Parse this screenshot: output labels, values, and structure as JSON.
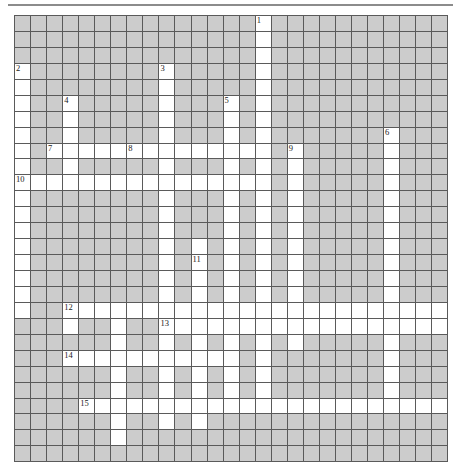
{
  "puzzle": {
    "type": "crossword-grid",
    "title": "",
    "columns": 27,
    "rows": 28,
    "cell_size_px": 16,
    "colors": {
      "block": "#cccccc",
      "open": "#ffffff",
      "gridline": "#5a5a5a",
      "rule": "#8c8c8c",
      "number": "#1a1a1a",
      "page": "#ffffff"
    },
    "numbers": [
      {
        "n": "1",
        "row": 0,
        "col": 15
      },
      {
        "n": "2",
        "row": 3,
        "col": 0
      },
      {
        "n": "3",
        "row": 3,
        "col": 9
      },
      {
        "n": "4",
        "row": 5,
        "col": 3
      },
      {
        "n": "5",
        "row": 5,
        "col": 13
      },
      {
        "n": "6",
        "row": 7,
        "col": 23
      },
      {
        "n": "7",
        "row": 8,
        "col": 2
      },
      {
        "n": "8",
        "row": 8,
        "col": 7
      },
      {
        "n": "9",
        "row": 8,
        "col": 17
      },
      {
        "n": "10",
        "row": 10,
        "col": 0
      },
      {
        "n": "11",
        "row": 15,
        "col": 11
      },
      {
        "n": "12",
        "row": 18,
        "col": 3
      },
      {
        "n": "13",
        "row": 19,
        "col": 9
      },
      {
        "n": "14",
        "row": 21,
        "col": 3
      },
      {
        "n": "15",
        "row": 24,
        "col": 4
      }
    ],
    "open_cells": [
      [
        0,
        15
      ],
      [
        1,
        15
      ],
      [
        2,
        15
      ],
      [
        3,
        0
      ],
      [
        3,
        9
      ],
      [
        3,
        15
      ],
      [
        4,
        0
      ],
      [
        4,
        9
      ],
      [
        4,
        15
      ],
      [
        5,
        0
      ],
      [
        5,
        3
      ],
      [
        5,
        9
      ],
      [
        5,
        13
      ],
      [
        5,
        15
      ],
      [
        6,
        0
      ],
      [
        6,
        3
      ],
      [
        6,
        9
      ],
      [
        6,
        13
      ],
      [
        6,
        15
      ],
      [
        7,
        0
      ],
      [
        7,
        3
      ],
      [
        7,
        9
      ],
      [
        7,
        13
      ],
      [
        7,
        15
      ],
      [
        7,
        23
      ],
      [
        8,
        0
      ],
      [
        8,
        2
      ],
      [
        8,
        3
      ],
      [
        8,
        4
      ],
      [
        8,
        5
      ],
      [
        8,
        6
      ],
      [
        8,
        7
      ],
      [
        8,
        8
      ],
      [
        8,
        9
      ],
      [
        8,
        10
      ],
      [
        8,
        11
      ],
      [
        8,
        12
      ],
      [
        8,
        13
      ],
      [
        8,
        14
      ],
      [
        8,
        15
      ],
      [
        8,
        17
      ],
      [
        8,
        23
      ],
      [
        9,
        0
      ],
      [
        9,
        3
      ],
      [
        9,
        9
      ],
      [
        9,
        13
      ],
      [
        9,
        15
      ],
      [
        9,
        17
      ],
      [
        9,
        23
      ],
      [
        10,
        0
      ],
      [
        10,
        1
      ],
      [
        10,
        2
      ],
      [
        10,
        3
      ],
      [
        10,
        4
      ],
      [
        10,
        5
      ],
      [
        10,
        6
      ],
      [
        10,
        7
      ],
      [
        10,
        8
      ],
      [
        10,
        9
      ],
      [
        10,
        10
      ],
      [
        10,
        11
      ],
      [
        10,
        12
      ],
      [
        10,
        13
      ],
      [
        10,
        14
      ],
      [
        10,
        15
      ],
      [
        10,
        17
      ],
      [
        10,
        23
      ],
      [
        11,
        0
      ],
      [
        11,
        9
      ],
      [
        11,
        13
      ],
      [
        11,
        15
      ],
      [
        11,
        17
      ],
      [
        11,
        23
      ],
      [
        12,
        0
      ],
      [
        12,
        9
      ],
      [
        12,
        13
      ],
      [
        12,
        15
      ],
      [
        12,
        17
      ],
      [
        12,
        23
      ],
      [
        13,
        0
      ],
      [
        13,
        9
      ],
      [
        13,
        13
      ],
      [
        13,
        15
      ],
      [
        13,
        17
      ],
      [
        13,
        23
      ],
      [
        14,
        0
      ],
      [
        14,
        9
      ],
      [
        14,
        11
      ],
      [
        14,
        13
      ],
      [
        14,
        15
      ],
      [
        14,
        17
      ],
      [
        14,
        23
      ],
      [
        15,
        0
      ],
      [
        15,
        9
      ],
      [
        15,
        11
      ],
      [
        15,
        13
      ],
      [
        15,
        15
      ],
      [
        15,
        17
      ],
      [
        15,
        23
      ],
      [
        16,
        0
      ],
      [
        16,
        9
      ],
      [
        16,
        11
      ],
      [
        16,
        13
      ],
      [
        16,
        15
      ],
      [
        16,
        17
      ],
      [
        16,
        23
      ],
      [
        17,
        0
      ],
      [
        17,
        9
      ],
      [
        17,
        11
      ],
      [
        17,
        13
      ],
      [
        17,
        15
      ],
      [
        17,
        17
      ],
      [
        17,
        23
      ],
      [
        18,
        0
      ],
      [
        18,
        3
      ],
      [
        18,
        4
      ],
      [
        18,
        5
      ],
      [
        18,
        6
      ],
      [
        18,
        7
      ],
      [
        18,
        8
      ],
      [
        18,
        9
      ],
      [
        18,
        10
      ],
      [
        18,
        11
      ],
      [
        18,
        12
      ],
      [
        18,
        13
      ],
      [
        18,
        14
      ],
      [
        18,
        15
      ],
      [
        18,
        16
      ],
      [
        18,
        17
      ],
      [
        18,
        18
      ],
      [
        18,
        19
      ],
      [
        18,
        20
      ],
      [
        18,
        21
      ],
      [
        18,
        22
      ],
      [
        18,
        23
      ],
      [
        18,
        24
      ],
      [
        18,
        25
      ],
      [
        18,
        26
      ],
      [
        19,
        3
      ],
      [
        19,
        6
      ],
      [
        19,
        9
      ],
      [
        19,
        10
      ],
      [
        19,
        11
      ],
      [
        19,
        12
      ],
      [
        19,
        13
      ],
      [
        19,
        14
      ],
      [
        19,
        15
      ],
      [
        19,
        16
      ],
      [
        19,
        17
      ],
      [
        19,
        18
      ],
      [
        19,
        19
      ],
      [
        19,
        20
      ],
      [
        19,
        21
      ],
      [
        19,
        22
      ],
      [
        19,
        23
      ],
      [
        19,
        24
      ],
      [
        19,
        25
      ],
      [
        19,
        26
      ],
      [
        20,
        6
      ],
      [
        20,
        9
      ],
      [
        20,
        11
      ],
      [
        20,
        13
      ],
      [
        20,
        15
      ],
      [
        20,
        17
      ],
      [
        20,
        23
      ],
      [
        21,
        3
      ],
      [
        21,
        4
      ],
      [
        21,
        5
      ],
      [
        21,
        6
      ],
      [
        21,
        7
      ],
      [
        21,
        8
      ],
      [
        21,
        9
      ],
      [
        21,
        10
      ],
      [
        21,
        11
      ],
      [
        21,
        12
      ],
      [
        21,
        13
      ],
      [
        21,
        15
      ],
      [
        21,
        23
      ],
      [
        22,
        6
      ],
      [
        22,
        9
      ],
      [
        22,
        11
      ],
      [
        22,
        13
      ],
      [
        22,
        15
      ],
      [
        22,
        23
      ],
      [
        23,
        6
      ],
      [
        23,
        9
      ],
      [
        23,
        11
      ],
      [
        23,
        13
      ],
      [
        23,
        15
      ],
      [
        23,
        23
      ],
      [
        24,
        4
      ],
      [
        24,
        5
      ],
      [
        24,
        6
      ],
      [
        24,
        7
      ],
      [
        24,
        8
      ],
      [
        24,
        9
      ],
      [
        24,
        10
      ],
      [
        24,
        11
      ],
      [
        24,
        12
      ],
      [
        24,
        13
      ],
      [
        24,
        14
      ],
      [
        24,
        15
      ],
      [
        24,
        16
      ],
      [
        24,
        17
      ],
      [
        24,
        18
      ],
      [
        24,
        19
      ],
      [
        24,
        20
      ],
      [
        24,
        21
      ],
      [
        24,
        22
      ],
      [
        24,
        23
      ],
      [
        24,
        24
      ],
      [
        24,
        25
      ],
      [
        24,
        26
      ],
      [
        25,
        6
      ],
      [
        25,
        9
      ],
      [
        25,
        11
      ],
      [
        26,
        6
      ]
    ]
  }
}
